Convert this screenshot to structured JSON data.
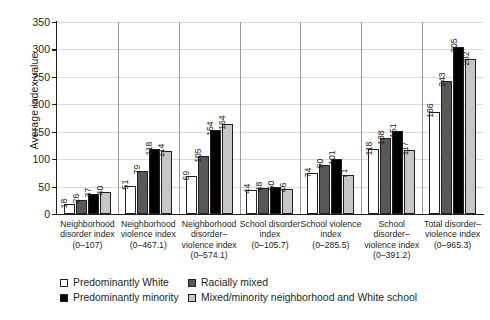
{
  "chart_data": {
    "type": "bar",
    "title": "",
    "xlabel": "",
    "ylabel": "Average index value",
    "ylim": [
      0,
      350
    ],
    "yticks": [
      0,
      50,
      100,
      150,
      200,
      250,
      300,
      350
    ],
    "grid": true,
    "legend_position": "bottom",
    "categories": [
      {
        "name": "Neighborhood disorder index",
        "range": "(0–107)"
      },
      {
        "name": "Neighborhood violence index",
        "range": "(0–467.1)"
      },
      {
        "name": "Neighborhood disorder–violence index",
        "range": "(0–574.1)"
      },
      {
        "name": "School disorder index",
        "range": "(0–105.7)"
      },
      {
        "name": "School violence index",
        "range": "(0–285.5)"
      },
      {
        "name": "School disorder–violence index",
        "range": "(0–391.2)"
      },
      {
        "name": "Total disorder–violence index",
        "range": "(0–965.3)"
      }
    ],
    "series": [
      {
        "name": "Predominantly White",
        "color": "#ffffff",
        "values": [
          18,
          51,
          69,
          44,
          74,
          118,
          186
        ]
      },
      {
        "name": "Racially mixed",
        "color": "#585858",
        "values": [
          26,
          79,
          105,
          48,
          90,
          138,
          243
        ]
      },
      {
        "name": "Predominantly minority",
        "color": "#000000",
        "values": [
          37,
          118,
          154,
          50,
          101,
          151,
          305
        ]
      },
      {
        "name": "Mixed/minority neighborhood and White school",
        "color": "#c6c6c6",
        "values": [
          40,
          114,
          164,
          46,
          71,
          117,
          282
        ]
      }
    ]
  },
  "legend": {
    "items": [
      {
        "label": "Predominantly White",
        "swatch": "s0"
      },
      {
        "label": "Racially mixed",
        "swatch": "s1"
      },
      {
        "label": "Predominantly minority",
        "swatch": "s2"
      },
      {
        "label": "Mixed/minority neighborhood and White school",
        "swatch": "s3"
      }
    ]
  }
}
